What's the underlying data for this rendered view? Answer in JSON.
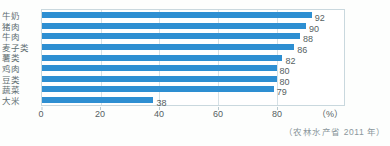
{
  "chart_data": {
    "type": "bar",
    "orientation": "horizontal",
    "categories": [
      "牛奶",
      "猪肉",
      "牛肉",
      "麦子类",
      "薯类",
      "鸡肉",
      "豆类",
      "蔬菜",
      "大米"
    ],
    "values": [
      92,
      90,
      88,
      86,
      82,
      80,
      80,
      79,
      38
    ],
    "title": "",
    "xlabel": "",
    "ylabel": "",
    "x_ticks": [
      0,
      20,
      40,
      60,
      80
    ],
    "xlim": [
      0,
      103
    ],
    "unit_label": "（%）",
    "source": "（农林水产省 2011 年）",
    "grid": "vertical",
    "legend": "none",
    "colors": {
      "bar": "#2e8fd2",
      "plot_border": "#c9d8de",
      "gridline": "#d6e1e6",
      "value_text": "#565f63",
      "category_text": "#5f6e72",
      "tick_text": "#565f63",
      "source_text": "#8b979c",
      "background": "#fdfefd"
    }
  }
}
